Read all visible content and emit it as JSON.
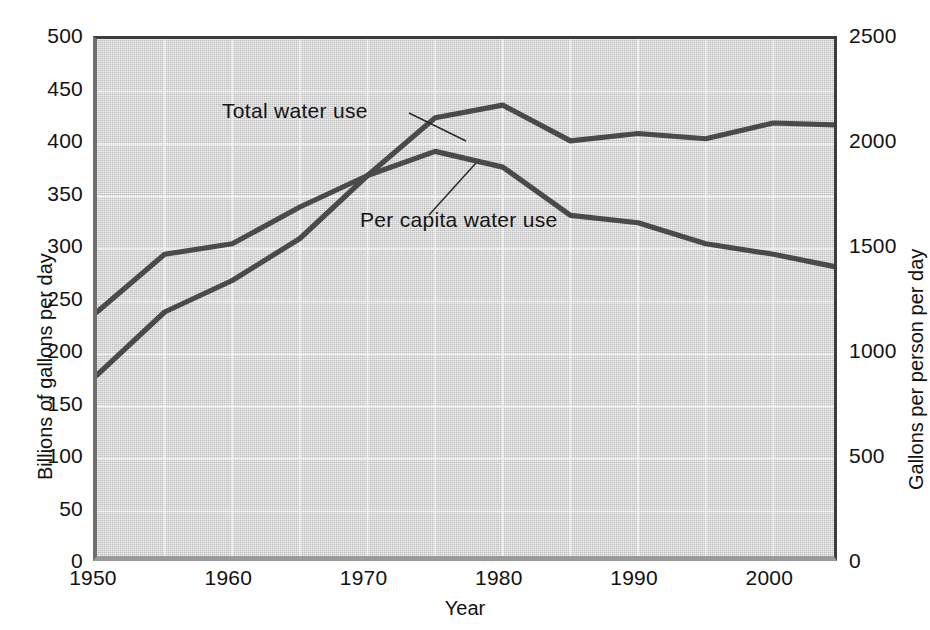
{
  "chart_data": {
    "type": "line",
    "title": "",
    "subtitle": "",
    "xlabel": "Year",
    "ylabel": "Billions of gallons per day",
    "ylabel_right": "Gallons per person per day",
    "xlim": [
      1950,
      2005
    ],
    "ylim": [
      0,
      500
    ],
    "ylim_right": [
      0,
      2500
    ],
    "grid": true,
    "legend_position": "inline-annotations",
    "xticks": [
      "1950",
      "1960",
      "1970",
      "1980",
      "1990",
      "2000"
    ],
    "xtick_values": [
      1950,
      1960,
      1970,
      1980,
      1990,
      2000
    ],
    "yticks_left": [
      "0",
      "50",
      "100",
      "150",
      "200",
      "250",
      "300",
      "350",
      "400",
      "450",
      "500"
    ],
    "ytick_left_values": [
      0,
      50,
      100,
      150,
      200,
      250,
      300,
      350,
      400,
      450,
      500
    ],
    "yticks_right": [
      "0",
      "500",
      "1000",
      "1500",
      "2000",
      "2500"
    ],
    "ytick_right_values": [
      0,
      500,
      1000,
      1500,
      2000,
      2500
    ],
    "x": [
      1950,
      1955,
      1960,
      1965,
      1970,
      1975,
      1980,
      1985,
      1990,
      1995,
      2000,
      2005
    ],
    "series": [
      {
        "name": "Total water use",
        "axis": "left",
        "units": "billions of gallons per day",
        "color": "#4a4a4a",
        "values": [
          180,
          240,
          270,
          310,
          370,
          425,
          437,
          403,
          410,
          405,
          420,
          418
        ]
      },
      {
        "name": "Per capita water use",
        "axis": "right",
        "units": "gallons per person per day",
        "left_axis_equivalent": [
          240,
          295,
          305,
          340,
          370,
          393,
          378,
          332,
          325,
          305,
          295,
          282
        ],
        "color": "#4a4a4a",
        "values": [
          1200,
          1475,
          1525,
          1700,
          1850,
          1965,
          1890,
          1660,
          1625,
          1525,
          1475,
          1410
        ]
      }
    ],
    "annotations": [
      {
        "label": "Total water use",
        "points_to_year": 1972,
        "points_to_value": 390
      },
      {
        "label": "Per capita water use",
        "points_to_year": 1977,
        "points_to_value": 385
      }
    ]
  }
}
